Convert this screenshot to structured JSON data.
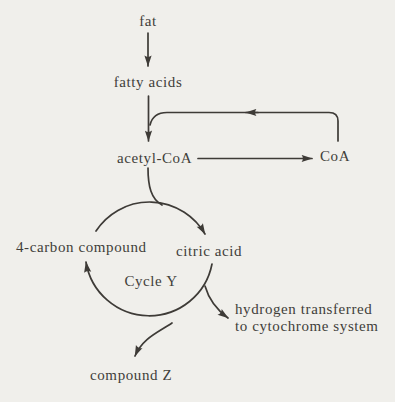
{
  "colors": {
    "background": "#f0efeb",
    "ink": "#3e3b37"
  },
  "diagram": {
    "nodes": {
      "fat": "fat",
      "fatty_acids": "fatty acids",
      "acetyl_coa": "acetyl-CoA",
      "coa": "CoA",
      "four_carbon_compound": "4-carbon compound",
      "citric_acid": "citric acid",
      "cycle_label": "Cycle Y",
      "hydrogen": {
        "line1": "hydrogen transferred",
        "line2": "to cytochrome system"
      },
      "compound_z": "compound Z"
    },
    "edges": [
      {
        "from": "fat",
        "to": "fatty acids"
      },
      {
        "from": "fatty acids",
        "to": "acetyl-CoA"
      },
      {
        "from": "acetyl-CoA",
        "to": "CoA"
      },
      {
        "from": "CoA",
        "to": "acetyl-CoA formation",
        "note": "recycle loop rejoining the fatty acids arrow"
      },
      {
        "from": "acetyl-CoA",
        "to": "citric acid",
        "note": "entry into Cycle Y"
      },
      {
        "from": "citric acid",
        "to": "4-carbon compound",
        "note": "around Cycle Y"
      },
      {
        "from": "citric acid",
        "to": "hydrogen transferred to cytochrome system"
      },
      {
        "from": "Cycle Y",
        "to": "compound Z"
      }
    ]
  }
}
